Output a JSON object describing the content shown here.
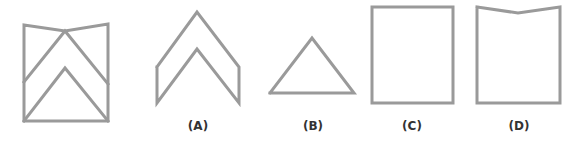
{
  "figure": {
    "question_figure": {
      "name": "folded-composite",
      "outline": "24,25 65,31 108,24 108,121 24,121",
      "chevron_outer": "24,82 65,31 108,84",
      "chevron_inner": "24,121 65,68 108,121"
    },
    "options": [
      {
        "label": "(A)",
        "label_x": 198,
        "name": "option-a-chevron",
        "path": "157,67 197,12 239,67 239,103 197,49 157,103 157,67"
      },
      {
        "label": "(B)",
        "label_x": 313,
        "name": "option-b-triangle",
        "path": "270,93 312,38 354,93 270,93"
      },
      {
        "label": "(C)",
        "label_x": 412,
        "name": "option-c-rectangle",
        "path": "372,7 453,7 453,103 372,103 372,7"
      },
      {
        "label": "(D)",
        "label_x": 519,
        "name": "option-d-notched-rectangle",
        "path": "477,7 518,13 560,7 560,103 477,103 477,7"
      }
    ],
    "stroke_color": "#9a9a9a",
    "label_color": "#333333"
  }
}
